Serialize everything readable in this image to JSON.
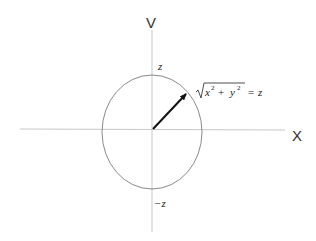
{
  "diagram": {
    "axes": {
      "horizontal_label": "X",
      "vertical_label": "V"
    },
    "circle_labels": {
      "top": "z",
      "bottom": "−z"
    },
    "radius_annotation": {
      "var_x": "x",
      "var_y": "y",
      "exponent": "2",
      "plus": "+",
      "equals": "=",
      "result": "z"
    },
    "colors": {
      "axis": "#c8c8c8",
      "circle": "#8a8a8a",
      "arrow": "#111111"
    }
  }
}
